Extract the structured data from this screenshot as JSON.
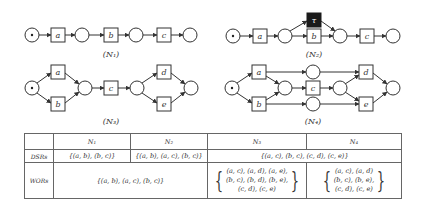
{
  "nets": [
    {
      "id": "N1",
      "caption": "(N₁)",
      "transitions": [
        "a",
        "b",
        "c"
      ]
    },
    {
      "id": "N2",
      "caption": "(N₂)",
      "transitions": [
        "a",
        "b",
        "τ",
        "c"
      ]
    },
    {
      "id": "N3",
      "caption": "(N₃)",
      "transitions": [
        "a",
        "b",
        "c",
        "d",
        "e"
      ]
    },
    {
      "id": "N4",
      "caption": "(N₄)",
      "transitions": [
        "a",
        "b",
        "c",
        "d",
        "e"
      ]
    }
  ],
  "table": {
    "headers": [
      "",
      "N₁",
      "N₂",
      "N₃",
      "N₄"
    ],
    "rows": [
      {
        "label": "DSRs",
        "n1": "{(a, b), (b, c)}",
        "n2": "{(a, b), (a, c), (b, c)}",
        "n34": "{(a, c), (b, c), (c, d), (c, e)}"
      },
      {
        "label": "WORs",
        "n12": "{(a, b), (a, c), (b, c)}",
        "n3_lines": [
          "(a, c), (a, d), (a, e),",
          "(b, c), (b, d), (b, e),",
          "(c, d), (c, e)"
        ],
        "n4_lines": [
          "(a, c), (a, d)",
          "(b, c), (b, e),",
          "(c, d), (c, e)"
        ]
      }
    ]
  },
  "colors": {
    "stroke": "#333333",
    "silent_transition": "#1a1a1a"
  }
}
